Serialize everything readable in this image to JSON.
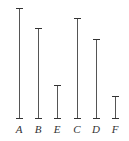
{
  "diagram": {
    "baseline_y": 118,
    "label_y": 123,
    "segments": [
      {
        "label": "A",
        "x": 19,
        "top": 8
      },
      {
        "label": "B",
        "x": 38,
        "top": 28
      },
      {
        "label": "E",
        "x": 57,
        "top": 85
      },
      {
        "label": "C",
        "x": 77,
        "top": 18
      },
      {
        "label": "D",
        "x": 96,
        "top": 39
      },
      {
        "label": "F",
        "x": 115,
        "top": 96
      }
    ],
    "colors": {
      "line": "#555555",
      "cap": "#333333",
      "text": "#333333"
    }
  }
}
